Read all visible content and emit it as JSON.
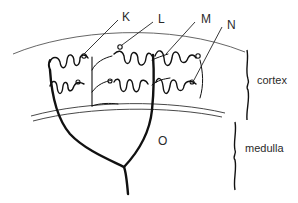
{
  "diagram": {
    "type": "anatomical illustration",
    "labels": {
      "K": "K",
      "L": "L",
      "M": "M",
      "N": "N",
      "O": "O"
    },
    "regions": {
      "cortex": "cortex",
      "medulla": "medulla"
    },
    "colors": {
      "ink": "#111111",
      "text": "#2a2a2a",
      "background": "#ffffff",
      "capsule_line": "#555555"
    }
  }
}
